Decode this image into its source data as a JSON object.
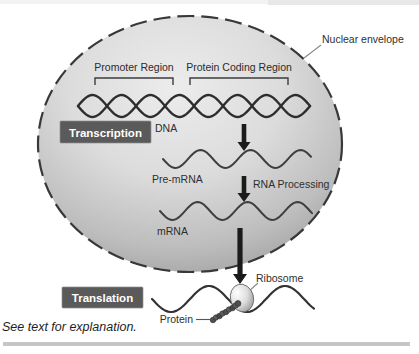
{
  "figure": {
    "caption": "See text for explanation.",
    "labels": {
      "nuclear_envelope": "Nuclear envelope",
      "promoter_region": "Promoter Region",
      "protein_coding_region": "Protein Coding Region",
      "dna": "DNA",
      "transcription": "Transcription",
      "pre_mrna": "Pre-mRNA",
      "rna_processing": "RNA Processing",
      "mrna": "mRNA",
      "ribosome": "Ribosome",
      "translation": "Translation",
      "protein": "Protein"
    },
    "colors": {
      "process_box_bg": "#5a5a5a",
      "process_box_text": "#ffffff",
      "nucleus_fill_light": "#ebebeb",
      "nucleus_fill_dark": "#a2a2a2",
      "outline": "#333333",
      "rule": "#c6c6c6"
    }
  }
}
